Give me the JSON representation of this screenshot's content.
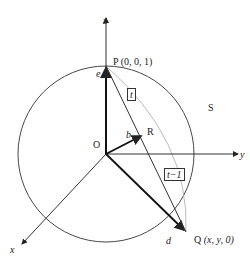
{
  "diagram": {
    "axes": {
      "x": "x",
      "y": "y",
      "z": "z"
    },
    "origin": "O",
    "sphere": "S",
    "points": {
      "P": {
        "name": "P",
        "coords": "(0,  0,  1)"
      },
      "Q": {
        "name": "Q",
        "coords": "(x,  y,  0)"
      },
      "R": {
        "name": "R"
      }
    },
    "vectors": {
      "e": "e",
      "b": "b",
      "d": "d"
    },
    "segment_labels": {
      "PR": "t",
      "RQ": "t−1"
    }
  }
}
